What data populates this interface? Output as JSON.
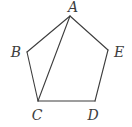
{
  "diagram": {
    "type": "geometry",
    "background": "#ffffff",
    "stroke_color": "#3d3d3d",
    "stroke_width": 1.1,
    "label_color": "#3d3d3d",
    "label_font_size": 14,
    "width": 132,
    "height": 127,
    "vertices": [
      {
        "id": "A",
        "label": "A",
        "x": 70,
        "y": 16,
        "label_x": 73,
        "label_y": 12,
        "anchor": "middle"
      },
      {
        "id": "B",
        "label": "B",
        "x": 27,
        "y": 52,
        "label_x": 16,
        "label_y": 57,
        "anchor": "middle"
      },
      {
        "id": "C",
        "label": "C",
        "x": 38,
        "y": 101,
        "label_x": 37,
        "label_y": 120,
        "anchor": "middle"
      },
      {
        "id": "D",
        "label": "D",
        "x": 95,
        "y": 101,
        "label_x": 93,
        "label_y": 120,
        "anchor": "middle"
      },
      {
        "id": "E",
        "label": "E",
        "x": 108,
        "y": 50,
        "label_x": 119,
        "label_y": 57,
        "anchor": "middle"
      }
    ],
    "edges": [
      {
        "from": "A",
        "to": "B",
        "kind": "side"
      },
      {
        "from": "B",
        "to": "C",
        "kind": "side"
      },
      {
        "from": "C",
        "to": "D",
        "kind": "side"
      },
      {
        "from": "D",
        "to": "E",
        "kind": "side"
      },
      {
        "from": "E",
        "to": "A",
        "kind": "side"
      },
      {
        "from": "A",
        "to": "C",
        "kind": "diagonal"
      }
    ]
  }
}
